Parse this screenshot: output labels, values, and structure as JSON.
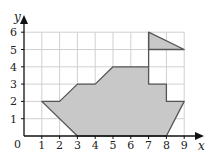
{
  "diagram": {
    "type": "coordinate-grid-polygon",
    "axes": {
      "x_label": "x",
      "y_label": "y",
      "origin_label": "0",
      "x_ticks": [
        "1",
        "2",
        "3",
        "4",
        "5",
        "6",
        "7",
        "8",
        "9"
      ],
      "y_ticks": [
        "1",
        "2",
        "3",
        "4",
        "5",
        "6"
      ],
      "x_range": [
        0,
        9
      ],
      "y_range": [
        0,
        6
      ]
    },
    "shapes": [
      {
        "name": "boat-hull",
        "points": [
          [
            1,
            2
          ],
          [
            2,
            2
          ],
          [
            3,
            3
          ],
          [
            4,
            3
          ],
          [
            5,
            4
          ],
          [
            7,
            4
          ],
          [
            7,
            3
          ],
          [
            8,
            3
          ],
          [
            8,
            2
          ],
          [
            9,
            2
          ],
          [
            8,
            0
          ],
          [
            3,
            0
          ]
        ],
        "fill": "#c8c8c8",
        "stroke": "#555555"
      },
      {
        "name": "flag",
        "points": [
          [
            7,
            6
          ],
          [
            9,
            5
          ],
          [
            7,
            5
          ]
        ],
        "fill": "#c8c8c8",
        "stroke": "#555555"
      }
    ],
    "mast": {
      "from": [
        7,
        4
      ],
      "to": [
        7,
        6
      ]
    },
    "colors": {
      "grid": "#d0d0d0",
      "axis": "#111111",
      "fill": "#c8c8c8",
      "outline": "#555555"
    }
  }
}
